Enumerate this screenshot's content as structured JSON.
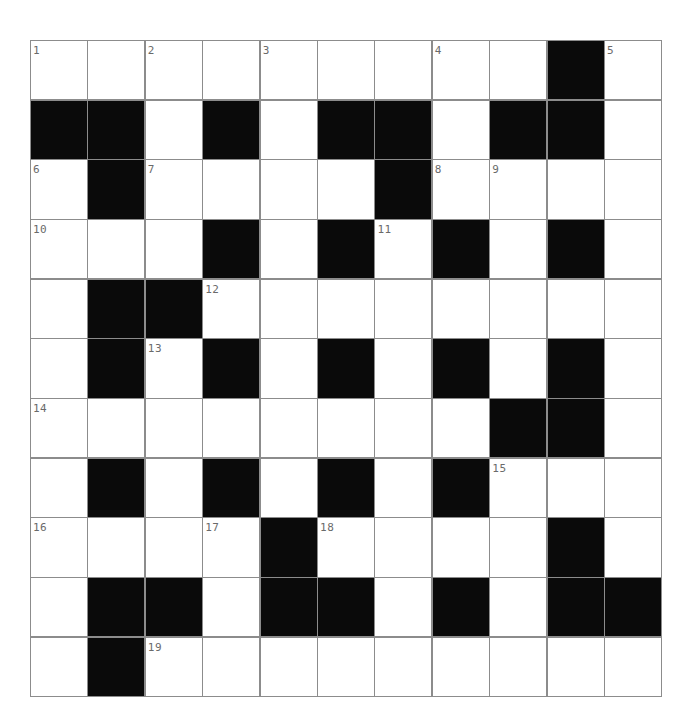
{
  "puzzle": {
    "rows": 11,
    "cols": 11,
    "colors": {
      "block": "#0a0a0a",
      "cell": "#ffffff",
      "gridline": "#8c8c8c",
      "number": "#6a6a6a"
    },
    "layout": [
      "WWWWWWWWWBW",
      "BBWBWBBWBBW",
      "WBWWWWBWWWW",
      "WWWBWBWBWBW",
      "WBBWWWWWWWW",
      "WBWBWBWBWBW",
      "WWWWWWWWBBW",
      "WBWBWBWBWWW",
      "WWWWBWWWWBW",
      "WBBWBBWBWBB",
      "WBWWWWWWWWW"
    ],
    "numbers": [
      {
        "row": 0,
        "col": 0,
        "label": "1"
      },
      {
        "row": 0,
        "col": 2,
        "label": "2"
      },
      {
        "row": 0,
        "col": 4,
        "label": "3"
      },
      {
        "row": 0,
        "col": 7,
        "label": "4"
      },
      {
        "row": 0,
        "col": 10,
        "label": "5"
      },
      {
        "row": 2,
        "col": 0,
        "label": "6"
      },
      {
        "row": 2,
        "col": 2,
        "label": "7"
      },
      {
        "row": 2,
        "col": 7,
        "label": "8"
      },
      {
        "row": 2,
        "col": 8,
        "label": "9"
      },
      {
        "row": 3,
        "col": 0,
        "label": "10"
      },
      {
        "row": 3,
        "col": 6,
        "label": "11"
      },
      {
        "row": 4,
        "col": 3,
        "label": "12"
      },
      {
        "row": 5,
        "col": 2,
        "label": "13"
      },
      {
        "row": 6,
        "col": 0,
        "label": "14"
      },
      {
        "row": 7,
        "col": 8,
        "label": "15"
      },
      {
        "row": 8,
        "col": 0,
        "label": "16"
      },
      {
        "row": 8,
        "col": 3,
        "label": "17"
      },
      {
        "row": 8,
        "col": 5,
        "label": "18"
      },
      {
        "row": 10,
        "col": 2,
        "label": "19"
      }
    ]
  }
}
